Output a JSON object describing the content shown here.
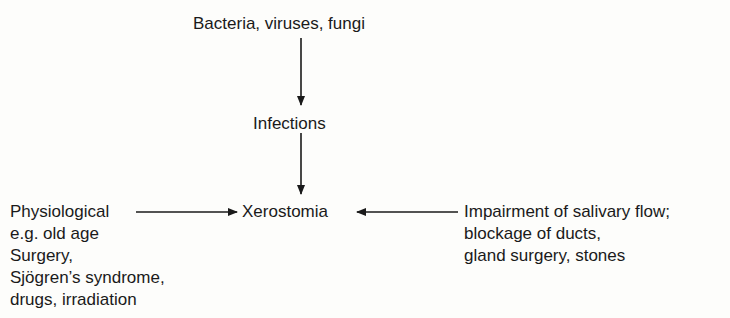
{
  "diagram": {
    "nodes": {
      "top": {
        "label": "Bacteria, viruses, fungi"
      },
      "middle": {
        "label": "Infections"
      },
      "center": {
        "label": "Xerostomia"
      },
      "left": {
        "lines": [
          "Physiological",
          "e.g. old age",
          "Surgery,",
          "Sjögren’s syndrome,",
          "drugs, irradiation"
        ]
      },
      "right": {
        "lines": [
          "Impairment of salivary flow;",
          "blockage of ducts,",
          "gland surgery, stones"
        ]
      }
    },
    "edges": [
      {
        "from": "top",
        "to": "middle"
      },
      {
        "from": "middle",
        "to": "center"
      },
      {
        "from": "left",
        "to": "center"
      },
      {
        "from": "right",
        "to": "center"
      }
    ],
    "colors": {
      "ink": "#1a1a1a",
      "background": "#fdfdfb"
    }
  }
}
